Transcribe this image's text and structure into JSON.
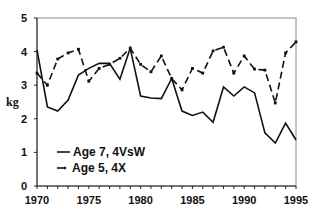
{
  "chart_data": {
    "type": "line",
    "title": "",
    "xlabel": "",
    "ylabel": "kg",
    "xlim": [
      1970,
      1995
    ],
    "ylim": [
      0,
      5
    ],
    "xticks": [
      1970,
      1975,
      1980,
      1985,
      1990,
      1995
    ],
    "xtick_labels": [
      "1970",
      "1975",
      "1980",
      "1985",
      "1990",
      "1995"
    ],
    "yticks": [
      0,
      1,
      2,
      3,
      4,
      5
    ],
    "ytick_labels": [
      "0",
      "1",
      "2",
      "3",
      "4",
      "5"
    ],
    "grid": false,
    "legend_position": "lower-left inside",
    "x": [
      1970,
      1971,
      1972,
      1973,
      1974,
      1975,
      1976,
      1977,
      1978,
      1979,
      1980,
      1981,
      1982,
      1983,
      1984,
      1985,
      1986,
      1987,
      1988,
      1989,
      1990,
      1991,
      1992,
      1993,
      1994,
      1995
    ],
    "series": [
      {
        "name": "Age 7, 4VsW",
        "style": "solid",
        "color": "#111111",
        "values": [
          4.05,
          2.35,
          2.23,
          2.56,
          3.3,
          3.5,
          3.65,
          3.65,
          3.18,
          4.1,
          2.68,
          2.62,
          2.6,
          3.2,
          2.23,
          2.1,
          2.2,
          1.9,
          2.95,
          2.68,
          2.95,
          2.77,
          1.58,
          1.28,
          1.87,
          1.37
        ]
      },
      {
        "name": "Age 5, 4X",
        "style": "dashed",
        "color": "#111111",
        "values": [
          3.36,
          3.0,
          3.78,
          3.96,
          4.07,
          3.12,
          3.5,
          3.62,
          3.8,
          4.1,
          3.62,
          3.4,
          3.87,
          3.2,
          2.86,
          3.5,
          3.36,
          4.02,
          4.13,
          3.36,
          3.87,
          3.48,
          3.45,
          2.47,
          3.96,
          4.29
        ]
      }
    ]
  },
  "legend": {
    "items": [
      {
        "label": "Age 7, 4VsW"
      },
      {
        "label": "Age 5, 4X"
      }
    ]
  }
}
